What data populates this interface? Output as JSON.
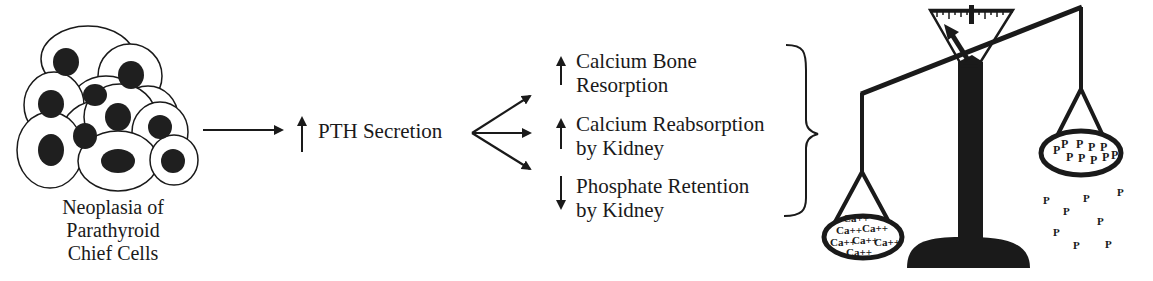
{
  "cells": {
    "caption_lines": [
      "Neoplasia of",
      "Parathyroid",
      "Chief Cells"
    ]
  },
  "pth": {
    "direction": "up",
    "label": "PTH Secretion"
  },
  "effects": [
    {
      "direction": "up",
      "lines": [
        "Calcium Bone",
        "Resorption"
      ]
    },
    {
      "direction": "up",
      "lines": [
        "Calcium Reabsorption",
        "by Kidney"
      ]
    },
    {
      "direction": "down",
      "lines": [
        "Phosphate Retention",
        "by Kidney"
      ]
    }
  ],
  "scale": {
    "left_pan_symbol": "Ca++",
    "right_pan_symbol": "P",
    "spilled_symbol": "P",
    "heavier_side": "left"
  },
  "colors": {
    "ink": "#1a1a1a",
    "background": "#ffffff"
  }
}
